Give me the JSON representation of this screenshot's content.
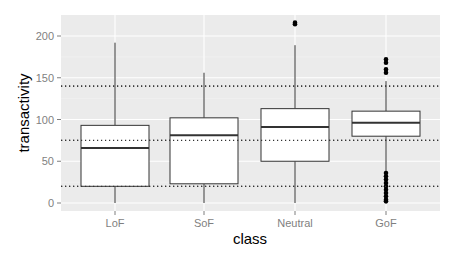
{
  "chart_data": {
    "type": "box",
    "title": "",
    "xlabel": "class",
    "ylabel": "transactivity",
    "categories": [
      "LoF",
      "SoF",
      "Neutral",
      "GoF"
    ],
    "yticks": [
      0,
      50,
      100,
      150,
      200
    ],
    "ylim": [
      -10,
      225
    ],
    "grid": true,
    "background": "#ebebeb",
    "reference_lines": [
      {
        "y": 20,
        "style": "dotted"
      },
      {
        "y": 75,
        "style": "dotted"
      },
      {
        "y": 140,
        "style": "dotted"
      }
    ],
    "boxes": [
      {
        "name": "LoF",
        "whisker_low": 0,
        "q1": 20,
        "median": 66,
        "q3": 93,
        "whisker_high": 192,
        "outliers": []
      },
      {
        "name": "SoF",
        "whisker_low": 0,
        "q1": 23,
        "median": 81,
        "q3": 102,
        "whisker_high": 156,
        "outliers": []
      },
      {
        "name": "Neutral",
        "whisker_low": 0,
        "q1": 50,
        "median": 91,
        "q3": 113,
        "whisker_high": 189,
        "outliers": [
          214,
          216
        ]
      },
      {
        "name": "GoF",
        "whisker_low": 38,
        "q1": 80,
        "median": 96,
        "q3": 110,
        "whisker_high": 146,
        "outliers": [
          172,
          168,
          160,
          156,
          36,
          32,
          28,
          24,
          20,
          16,
          12,
          8,
          4,
          2
        ]
      }
    ]
  }
}
